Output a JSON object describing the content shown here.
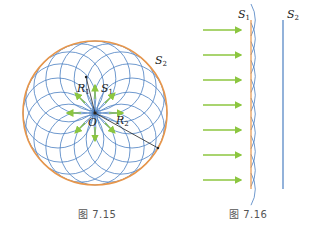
{
  "figure_left": {
    "caption": "图 7.15",
    "labels": {
      "S2": "S",
      "S2_sub": "2",
      "S1": "S",
      "S1_sub": "1",
      "R1": "R",
      "R1_sub": "1",
      "R2": "R",
      "R2_sub": "2",
      "O": "O"
    },
    "colors": {
      "outer_circle": "#e8964a",
      "wavelets": "#4a7fc1",
      "arrows": "#8cc63f",
      "radius_lines": "#222222"
    }
  },
  "figure_right": {
    "caption": "图 7.16",
    "labels": {
      "S1": "S",
      "S1_sub": "1",
      "S2": "S",
      "S2_sub": "2"
    },
    "colors": {
      "S1_line": "#e8964a",
      "S2_line": "#4a7fc1",
      "wavelets": "#4a7fc1",
      "arrows": "#8cc63f"
    },
    "arrow_count": 7
  }
}
